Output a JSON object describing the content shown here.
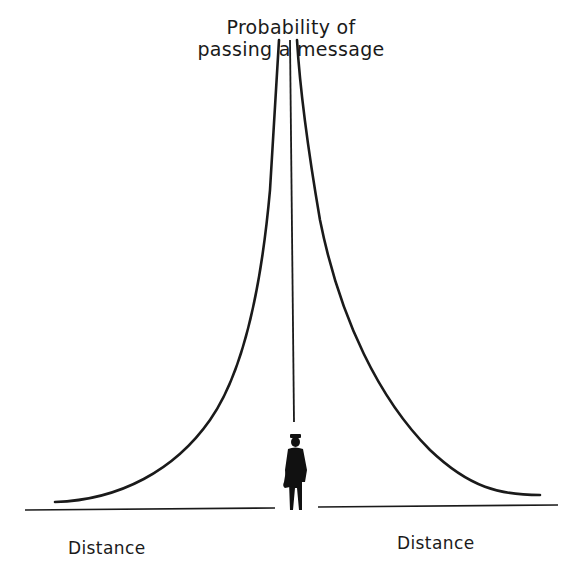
{
  "diagram": {
    "title_line1": "Probability of",
    "title_line2": "passing a message",
    "left_axis_label": "Distance",
    "right_axis_label": "Distance",
    "icons": [
      "person-figure-icon"
    ],
    "colors": {
      "ink": "#1a1a1a",
      "background": "#ffffff"
    }
  }
}
